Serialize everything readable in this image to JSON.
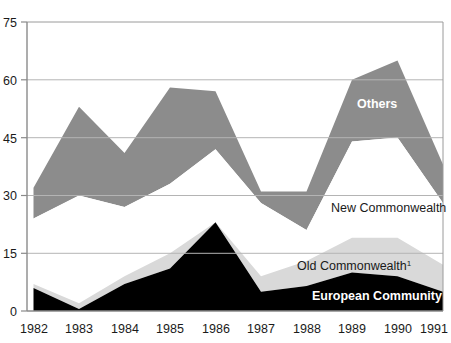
{
  "chart_data": {
    "type": "area",
    "title": "",
    "subtitle": "",
    "xlabel": "",
    "ylabel": "",
    "categories": [
      "1982",
      "1983",
      "1984",
      "1985",
      "1986",
      "1987",
      "1988",
      "1989",
      "1990",
      "1991"
    ],
    "ylim": [
      0,
      75
    ],
    "yticks": [
      0,
      15,
      30,
      45,
      60,
      75
    ],
    "xticks": [
      "1982",
      "1983",
      "1984",
      "1985",
      "1986",
      "1987",
      "1988",
      "1989",
      "1990",
      "1991"
    ],
    "grid": true,
    "stacked": true,
    "legend": "inline-labels",
    "series": [
      {
        "name": "European Community",
        "color": "#000000",
        "label_color": "#ffffff",
        "label_bold": true,
        "values": [
          6,
          0.5,
          7,
          11,
          23,
          5,
          6.5,
          10,
          9,
          5
        ]
      },
      {
        "name": "Old Commonwealth",
        "footnote": "1",
        "color": "#d9d9d9",
        "label_color": "#1a1a1a",
        "label_bold": false,
        "values": [
          1,
          1.5,
          2,
          4,
          0,
          4,
          6.5,
          9,
          10,
          7
        ]
      },
      {
        "name": "New Commonwealth",
        "color": "#ffffff",
        "label_color": "#1a1a1a",
        "label_bold": false,
        "values": [
          17,
          28,
          18,
          18,
          19,
          19,
          8,
          25,
          26,
          16
        ]
      },
      {
        "name": "Others",
        "color": "#8c8c8c",
        "label_color": "#ffffff",
        "label_bold": true,
        "values": [
          8,
          23,
          14,
          25,
          15,
          3,
          10,
          16,
          20,
          10
        ]
      }
    ],
    "cumulative": {
      "european_community": [
        6,
        0.5,
        7,
        11,
        23,
        5,
        6.5,
        10,
        9,
        5
      ],
      "old_commonwealth": [
        7,
        2,
        9,
        15,
        23,
        9,
        13,
        19,
        19,
        12
      ],
      "new_commonwealth": [
        24,
        30,
        27,
        33,
        42,
        28,
        21,
        44,
        45,
        28
      ],
      "others": [
        32,
        53,
        41,
        58,
        57,
        31,
        31,
        60,
        65,
        38
      ]
    }
  },
  "labels": {
    "others": "Others",
    "new_commonwealth": "New Commonwealth",
    "old_commonwealth": "Old Commonwealth",
    "old_commonwealth_footnote": "1",
    "european_community": "European Community"
  },
  "axis": {
    "y": {
      "t0": "0",
      "t15": "15",
      "t30": "30",
      "t45": "45",
      "t60": "60",
      "t75": "75"
    },
    "x": {
      "y1982": "1982",
      "y1983": "1983",
      "y1984": "1984",
      "y1985": "1985",
      "y1986": "1986",
      "y1987": "1987",
      "y1988": "1988",
      "y1989": "1989",
      "y1990": "1990",
      "y1991": "1991"
    }
  },
  "colors": {
    "european_community": "#000000",
    "old_commonwealth": "#d9d9d9",
    "new_commonwealth": "#ffffff",
    "others": "#8c8c8c",
    "axis": "#8a8a8a",
    "grid": "#b0b0b0",
    "text": "#1a1a1a"
  }
}
